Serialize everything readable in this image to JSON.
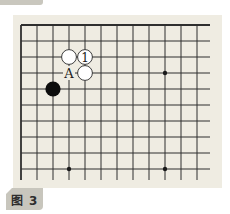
{
  "figure": {
    "label": "图 3"
  },
  "board": {
    "columns": 12,
    "rows": 10,
    "origin_x": 21,
    "origin_y": 25,
    "spacing": 16,
    "line_color": "#2f2f2f",
    "background": "#efece2",
    "open_right_extension": 13,
    "open_bottom_extension": 11,
    "star_points": [
      {
        "col": 9,
        "row": 3
      },
      {
        "col": 3,
        "row": 9
      },
      {
        "col": 9,
        "row": 9
      }
    ],
    "stones": [
      {
        "color": "white",
        "col": 3,
        "row": 2,
        "label": ""
      },
      {
        "color": "white",
        "col": 4,
        "row": 2,
        "label": "1"
      },
      {
        "color": "white",
        "col": 4,
        "row": 3,
        "label": ""
      },
      {
        "color": "black",
        "col": 2,
        "row": 4,
        "label": ""
      }
    ],
    "markers": [
      {
        "col": 3,
        "row": 3,
        "label": "A"
      }
    ]
  }
}
